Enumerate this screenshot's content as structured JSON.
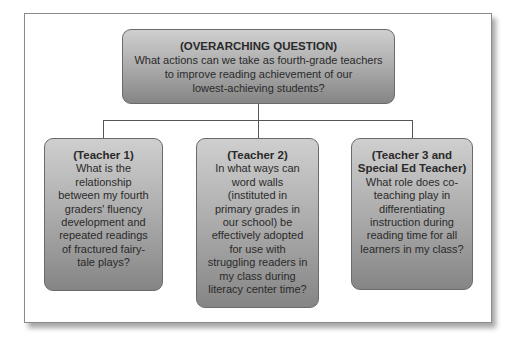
{
  "diagram": {
    "type": "hierarchy",
    "colors": {
      "node_fill_top": "#cfcfcf",
      "node_fill_bottom": "#858585",
      "node_border": "#6a6a6a",
      "text": "#2a2a2a",
      "connector": "#555555",
      "frame_border": "#8a8a8a"
    },
    "root": {
      "heading": "(OVERARCHING QUESTION)",
      "lines": [
        "What actions can we take as fourth-grade teachers",
        "to improve reading achievement of our",
        "lowest-achieving students?"
      ]
    },
    "children": [
      {
        "heading": "(Teacher 1)",
        "lines": [
          "What is the",
          "relationship",
          "between my fourth",
          "graders' fluency",
          "development and",
          "repeated readings",
          "of fractured fairy-",
          "tale plays?"
        ]
      },
      {
        "heading": "(Teacher 2)",
        "lines": [
          "In what ways can",
          "word walls",
          "(instituted in",
          "primary grades in",
          "our school) be",
          "effectively adopted",
          "for use with",
          "struggling readers in",
          "my class during",
          "literacy center time?"
        ]
      },
      {
        "heading_lines": [
          "(Teacher 3 and",
          "Special Ed Teacher)"
        ],
        "lines": [
          "What role does co-",
          "teaching play in",
          "differentiating",
          "instruction during",
          "reading time for all",
          "learners in my class?"
        ]
      }
    ]
  }
}
